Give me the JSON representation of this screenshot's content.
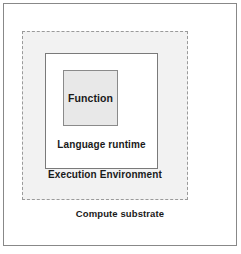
{
  "diagram": {
    "type": "nested-layers",
    "layers": [
      {
        "id": "compute-substrate",
        "label": "Compute substrate",
        "level": 0,
        "border_style": "solid",
        "border_color": "#888888",
        "fill_color": "#ffffff"
      },
      {
        "id": "execution-environment",
        "label": "Execution Environment",
        "level": 1,
        "border_style": "dashed",
        "border_color": "#9a9a9a",
        "fill_color": "#f2f2f2"
      },
      {
        "id": "language-runtime",
        "label": "Language runtime",
        "level": 2,
        "border_style": "solid",
        "border_color": "#7a7a7a",
        "fill_color": "#ffffff"
      },
      {
        "id": "function",
        "label": "Function",
        "level": 3,
        "border_style": "solid",
        "border_color": "#8a8a8a",
        "fill_color": "#e8e8e8"
      }
    ],
    "text_color": "#1a1a1a"
  }
}
